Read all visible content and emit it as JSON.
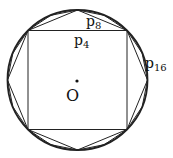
{
  "diagram": {
    "type": "inscribed-polygons-in-circle",
    "center_label": "O",
    "polygon_labels": {
      "p4": {
        "base": "p",
        "sub": "4"
      },
      "p8": {
        "base": "p",
        "sub": "8"
      },
      "p16": {
        "base": "p",
        "sub": "16"
      }
    },
    "colors": {
      "stroke": "#222222",
      "background": "#ffffff"
    }
  }
}
